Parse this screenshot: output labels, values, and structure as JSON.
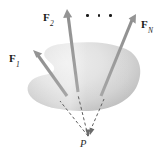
{
  "figure": {
    "type": "free-body-diagram",
    "background_color": "#ffffff",
    "body": {
      "name": "rigid-body-blob",
      "fill_light": "#e6e6e6",
      "fill_dark": "#b9b9b9",
      "shape": "irregular oval with concave notch on left side"
    },
    "forces": [
      {
        "id": "F1",
        "label_main": "F",
        "label_sub": "1",
        "label_x": 9,
        "label_y": 53,
        "tail_x": 67,
        "tail_y": 96,
        "tip_x": 33,
        "tip_y": 50,
        "color": "#9a9a9a"
      },
      {
        "id": "F2",
        "label_main": "F",
        "label_sub": "2",
        "label_x": 43,
        "label_y": 12,
        "tail_x": 78,
        "tail_y": 92,
        "tip_x": 67,
        "tip_y": 9,
        "color": "#9a9a9a"
      },
      {
        "id": "FN",
        "label_main": "F",
        "label_sub": "N",
        "label_x": 141,
        "label_y": 19,
        "tail_x": 101,
        "tail_y": 96,
        "tip_x": 136,
        "tip_y": 14,
        "color": "#9a9a9a"
      }
    ],
    "ellipsis": {
      "name": "force-series-ellipsis",
      "dot_count": 3,
      "x": 86,
      "y": 14
    },
    "concurrency_point": {
      "label": "P",
      "label_x": 80,
      "label_y": 139,
      "x": 88,
      "y": 136
    },
    "lines_of_action": {
      "style": "dashed",
      "color": "#5e5e5e",
      "dash_pattern": "3,2.4"
    },
    "colors": {
      "arrow_gray": "#9a9a9a",
      "arrow_gray_dark": "#848484",
      "dash_gray": "#5e5e5e",
      "label_black": "#1a1a1a",
      "blob_light": "#e6e6e6",
      "blob_dark": "#b9b9b9"
    }
  }
}
